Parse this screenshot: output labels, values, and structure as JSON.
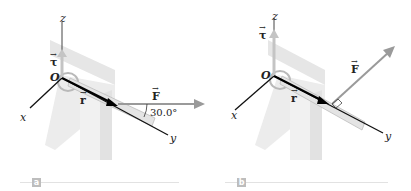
{
  "figure": {
    "panels": [
      {
        "id": "a",
        "tag": "a",
        "labels": {
          "origin": "O",
          "x_axis": "x",
          "y_axis": "y",
          "z_axis": "z",
          "torque": "τ",
          "position": "r",
          "force": "F",
          "angle": "30.0°"
        },
        "force_direction": "horizontal, 30.0° from y-axis"
      },
      {
        "id": "b",
        "tag": "b",
        "labels": {
          "origin": "O",
          "x_axis": "x",
          "y_axis": "y",
          "z_axis": "z",
          "torque": "τ",
          "position": "r",
          "force": "F"
        },
        "force_direction": "perpendicular to r"
      }
    ],
    "vector_arrow_glyph": "→",
    "colors": {
      "force": "#9a9a9a",
      "torque": "#b0b0b0",
      "position": "#111111",
      "axis": "#222222",
      "table": "#dcdcdc",
      "tag": "#bdbdbd"
    }
  }
}
